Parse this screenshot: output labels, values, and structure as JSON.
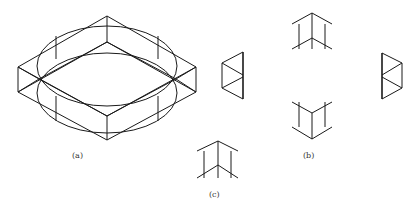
{
  "figure": {
    "line_color": "#1a1a1a",
    "background": "#ffffff"
  },
  "panels": [
    {
      "id": "a",
      "label": "(a)",
      "content": "isometric-frame-with-ellipses"
    },
    {
      "id": "b",
      "label": "(b)",
      "content": "four-orthographic-views"
    },
    {
      "id": "c",
      "label": "(c)",
      "content": "single-front-view"
    }
  ]
}
